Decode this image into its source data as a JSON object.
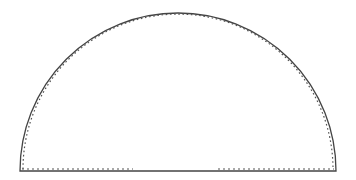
{
  "figure": {
    "shape": "semicircle",
    "width": 356,
    "height": 180,
    "colors": {
      "background": "#ffffff",
      "outline": "#444444",
      "dotted": "#555555"
    },
    "outline": {
      "style": "solid",
      "base_y": 171,
      "left_x": 20,
      "right_x": 336,
      "top_y": 13
    },
    "inner_trace": {
      "style": "dotted",
      "offset": 3,
      "base_segments": [
        {
          "x1": 22,
          "x2": 133
        },
        {
          "x1": 218,
          "x2": 334
        }
      ]
    }
  }
}
